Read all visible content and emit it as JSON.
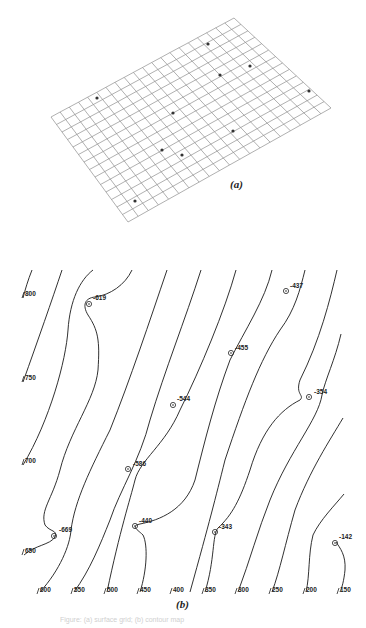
{
  "figure": {
    "panel_a": {
      "label": "(a)",
      "description": "Perspective wireframe grid surface with data points",
      "grid_corners": {
        "left": [
          51,
          117
        ],
        "top": [
          234,
          18
        ],
        "right": [
          331,
          108
        ],
        "bottom": [
          128,
          222
        ]
      },
      "rows": 14,
      "cols": 20,
      "points": [
        [
          97,
          98
        ],
        [
          173,
          113
        ],
        [
          220,
          75
        ],
        [
          208,
          44
        ],
        [
          250,
          66
        ],
        [
          309,
          91
        ],
        [
          233,
          131
        ],
        [
          162,
          150
        ],
        [
          182,
          155
        ],
        [
          135,
          201
        ]
      ]
    },
    "panel_b": {
      "label": "(b)",
      "description": "Contour map of surface with labeled data points",
      "left_contour_labels": [
        {
          "text": "800",
          "x": 25,
          "y": 296
        },
        {
          "text": "750",
          "x": 25,
          "y": 380
        },
        {
          "text": "700",
          "x": 25,
          "y": 463
        },
        {
          "text": "650",
          "x": 25,
          "y": 553
        }
      ],
      "bottom_contour_labels": [
        {
          "text": "600",
          "x": 40,
          "y": 592
        },
        {
          "text": "550",
          "x": 74,
          "y": 592
        },
        {
          "text": "500",
          "x": 107,
          "y": 592
        },
        {
          "text": "450",
          "x": 140,
          "y": 592
        },
        {
          "text": "400",
          "x": 173,
          "y": 592
        },
        {
          "text": "350",
          "x": 205,
          "y": 592
        },
        {
          "text": "300",
          "x": 238,
          "y": 592
        },
        {
          "text": "250",
          "x": 272,
          "y": 592
        },
        {
          "text": "200",
          "x": 306,
          "y": 592
        },
        {
          "text": "150",
          "x": 340,
          "y": 592
        }
      ],
      "data_points": [
        {
          "value": "-619",
          "x": 89,
          "y": 304,
          "lx": 93,
          "ly": 300
        },
        {
          "value": "-437",
          "x": 286,
          "y": 291,
          "lx": 290,
          "ly": 288
        },
        {
          "value": "-455",
          "x": 231,
          "y": 353,
          "lx": 235,
          "ly": 350
        },
        {
          "value": "-544",
          "x": 173,
          "y": 405,
          "lx": 177,
          "ly": 401
        },
        {
          "value": "-354",
          "x": 309,
          "y": 397,
          "lx": 314,
          "ly": 394
        },
        {
          "value": "-586",
          "x": 128,
          "y": 469,
          "lx": 133,
          "ly": 466
        },
        {
          "value": "-669",
          "x": 54,
          "y": 536,
          "lx": 59,
          "ly": 532
        },
        {
          "value": "-440",
          "x": 135,
          "y": 526,
          "lx": 139,
          "ly": 523
        },
        {
          "value": "-343",
          "x": 215,
          "y": 532,
          "lx": 219,
          "ly": 529
        },
        {
          "value": "-142",
          "x": 335,
          "y": 543,
          "lx": 339,
          "ly": 539
        }
      ]
    },
    "caption": "Figure: (a) surface grid; (b) contour map"
  }
}
